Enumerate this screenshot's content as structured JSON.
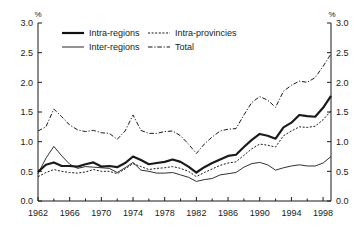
{
  "chart_data": {
    "type": "line",
    "title": "",
    "xlabel": "",
    "ylabel": "%",
    "y_unit_left": "%",
    "y_unit_right": "%",
    "xlim": [
      1962,
      1999
    ],
    "ylim": [
      0.0,
      3.0
    ],
    "grid": false,
    "legend_position": "top-left inside plot",
    "y_ticks": [
      "0.0",
      "0.5",
      "1.0",
      "1.5",
      "2.0",
      "2.5",
      "3.0"
    ],
    "y_tick_values": [
      0.0,
      0.5,
      1.0,
      1.5,
      2.0,
      2.5,
      3.0
    ],
    "x_ticks": [
      "1962",
      "1966",
      "1970",
      "1974",
      "1978",
      "1982",
      "1986",
      "1990",
      "1994",
      "1998"
    ],
    "x_tick_values": [
      1962,
      1966,
      1970,
      1974,
      1978,
      1982,
      1986,
      1990,
      1994,
      1998
    ],
    "x_minor_tick_values": [
      1964,
      1968,
      1972,
      1976,
      1980,
      1984,
      1988,
      1992,
      1996
    ],
    "x": [
      1962,
      1963,
      1964,
      1965,
      1966,
      1967,
      1968,
      1969,
      1970,
      1971,
      1972,
      1973,
      1974,
      1975,
      1976,
      1977,
      1978,
      1979,
      1980,
      1981,
      1982,
      1983,
      1984,
      1985,
      1986,
      1987,
      1988,
      1989,
      1990,
      1991,
      1992,
      1993,
      1994,
      1995,
      1996,
      1997,
      1998,
      1999
    ],
    "series": [
      {
        "name": "Intra-regions",
        "style": "thick-solid",
        "color": "#111111",
        "values": [
          0.49,
          0.61,
          0.65,
          0.59,
          0.59,
          0.58,
          0.62,
          0.65,
          0.58,
          0.59,
          0.57,
          0.64,
          0.75,
          0.69,
          0.62,
          0.64,
          0.66,
          0.7,
          0.66,
          0.58,
          0.48,
          0.57,
          0.64,
          0.7,
          0.76,
          0.78,
          0.91,
          1.03,
          1.13,
          1.1,
          1.05,
          1.24,
          1.32,
          1.45,
          1.43,
          1.42,
          1.57,
          1.77
        ]
      },
      {
        "name": "Inter-regions",
        "style": "thin-solid",
        "color": "#333333",
        "values": [
          0.46,
          0.72,
          0.92,
          0.76,
          0.62,
          0.55,
          0.58,
          0.57,
          0.56,
          0.55,
          0.48,
          0.56,
          0.65,
          0.52,
          0.5,
          0.47,
          0.47,
          0.48,
          0.44,
          0.4,
          0.33,
          0.36,
          0.38,
          0.44,
          0.46,
          0.48,
          0.57,
          0.63,
          0.65,
          0.61,
          0.52,
          0.56,
          0.59,
          0.61,
          0.59,
          0.59,
          0.64,
          0.75
        ]
      },
      {
        "name": "Intra-provincies",
        "style": "dotted",
        "color": "#222222",
        "values": [
          0.41,
          0.48,
          0.53,
          0.5,
          0.48,
          0.47,
          0.49,
          0.53,
          0.5,
          0.5,
          0.46,
          0.54,
          0.63,
          0.58,
          0.53,
          0.55,
          0.56,
          0.58,
          0.55,
          0.5,
          0.41,
          0.48,
          0.54,
          0.6,
          0.64,
          0.66,
          0.77,
          0.88,
          0.96,
          0.94,
          0.91,
          1.1,
          1.18,
          1.25,
          1.24,
          1.26,
          1.37,
          1.52
        ]
      },
      {
        "name": "Total",
        "style": "dash-dot",
        "color": "#222222",
        "values": [
          1.18,
          1.25,
          1.55,
          1.42,
          1.28,
          1.2,
          1.17,
          1.19,
          1.15,
          1.14,
          1.04,
          1.18,
          1.45,
          1.19,
          1.14,
          1.14,
          1.17,
          1.18,
          1.1,
          0.96,
          0.8,
          0.96,
          1.08,
          1.18,
          1.21,
          1.22,
          1.45,
          1.66,
          1.76,
          1.7,
          1.58,
          1.85,
          1.95,
          2.02,
          2.0,
          2.08,
          2.27,
          2.48
        ]
      }
    ],
    "legend": [
      {
        "label": "Intra-regions",
        "style": "thick-solid"
      },
      {
        "label": "Intra-provincies",
        "style": "dotted"
      },
      {
        "label": "Inter-regions",
        "style": "thin-solid"
      },
      {
        "label": "Total",
        "style": "dash-dot"
      }
    ]
  }
}
